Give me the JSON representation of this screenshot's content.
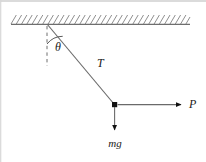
{
  "figure": {
    "kind": "free-body-diagram",
    "width": 206,
    "height": 162,
    "background_color": "#ffffff",
    "border_color": "#c8c8c8",
    "stroke_color": "#4a4a4a",
    "hatch_color": "#8c8c8c",
    "node_color": "#111111"
  },
  "labels": {
    "angle": "θ",
    "tension": "T",
    "weight": "mg",
    "applied_force": "P"
  },
  "geometry": {
    "ceiling": {
      "left_x": 11,
      "right_x": 190,
      "baseline_y": 24,
      "hatch_height": 9,
      "hatch_count": 34
    },
    "pivot": {
      "x": 47,
      "y": 24
    },
    "mass_node": {
      "x": 114.5,
      "y": 104.5,
      "size": 5
    },
    "dashed_vertical": {
      "x": 47,
      "y_start": 26,
      "y_end": 66
    },
    "angle_arc": {
      "radius": 20,
      "start_deg": 90,
      "end_deg": 52
    },
    "string_arrow_tip": {
      "x": 96,
      "y": 81
    },
    "weight_arrow": {
      "x": 114.5,
      "y_start": 107,
      "y_end": 131
    },
    "force_arrow": {
      "y": 104.5,
      "x_start": 117,
      "x_end": 182
    }
  },
  "label_positions": {
    "angle": {
      "x": 55,
      "y": 51
    },
    "tension": {
      "x": 97,
      "y": 67
    },
    "weight": {
      "x": 115,
      "y": 147
    },
    "applied_force": {
      "x": 190,
      "y": 108
    }
  }
}
